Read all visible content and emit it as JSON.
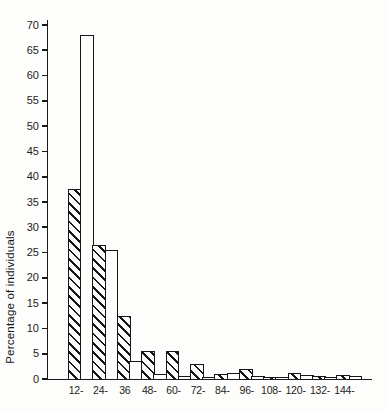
{
  "chart_data": {
    "type": "bar",
    "title": "",
    "xlabel": "",
    "ylabel": "Percentage of individuals",
    "categories": [
      "12-",
      "24-",
      "36",
      "48-",
      "60-",
      "72-",
      "84-",
      "96-",
      "108-",
      "120-",
      "132-",
      "144-"
    ],
    "series": [
      {
        "name": "hatched",
        "values": [
          37.5,
          26.5,
          12.5,
          5.5,
          5.5,
          3.0,
          1.0,
          2.0,
          0.4,
          1.1,
          0.5,
          0.8
        ]
      },
      {
        "name": "open",
        "values": [
          68.0,
          25.5,
          3.5,
          1.0,
          0.5,
          0.3,
          1.2,
          0.6,
          0.4,
          0.7,
          0.4,
          0.6
        ]
      }
    ],
    "ylim": [
      0,
      70
    ],
    "yticks": [
      0,
      5,
      10,
      15,
      20,
      25,
      30,
      35,
      40,
      45,
      50,
      55,
      60,
      65,
      70
    ],
    "grid": false,
    "legend": "none",
    "bar_style": "outlined, series 1 diagonally hatched, series 2 open white, bars contiguous",
    "ink_color": "#1a1a1a",
    "paper_color": "#fdfdfb"
  }
}
